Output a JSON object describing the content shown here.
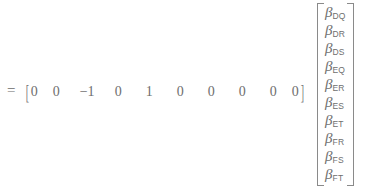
{
  "equation": {
    "equals_symbol": "=",
    "row_vector": {
      "open_bracket": "[",
      "close_bracket": "]",
      "entries": [
        "0",
        "0",
        "−1",
        "0",
        "1",
        "0",
        "0",
        "0",
        "0",
        "0"
      ]
    },
    "column_vector": {
      "symbol": "β",
      "subscripts": [
        "DQ",
        "DR",
        "DS",
        "EQ",
        "ER",
        "ES",
        "ET",
        "FR",
        "FS",
        "FT"
      ]
    },
    "colors": {
      "text": "#6e6e6e",
      "bracket": "#8a8a8a",
      "background": "#ffffff"
    }
  }
}
